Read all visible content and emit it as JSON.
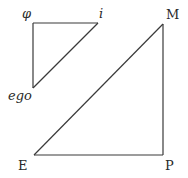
{
  "diagram": {
    "type": "two right-triangle schema",
    "small_triangle": {
      "vertices": {
        "phi": {
          "label": "φ",
          "x": 33,
          "y": 23
        },
        "i": {
          "label": "i",
          "x": 98,
          "y": 23
        },
        "ego": {
          "label": "ego",
          "x": 33,
          "y": 88
        }
      },
      "edges": [
        [
          "phi",
          "i"
        ],
        [
          "phi",
          "ego"
        ],
        [
          "i",
          "ego"
        ]
      ]
    },
    "large_triangle": {
      "vertices": {
        "M": {
          "label": "M",
          "x": 163,
          "y": 24
        },
        "P": {
          "label": "P",
          "x": 163,
          "y": 155
        },
        "E": {
          "label": "E",
          "x": 34,
          "y": 155
        }
      },
      "edges": [
        [
          "M",
          "P"
        ],
        [
          "P",
          "E"
        ],
        [
          "E",
          "M"
        ]
      ]
    },
    "labels": {
      "phi": "φ",
      "i": "i",
      "ego": "ego",
      "M": "M",
      "E": "E",
      "P": "P"
    },
    "colors": {
      "line": "#3a3a3a",
      "text": "#2a2a2a",
      "background": "#ffffff"
    }
  }
}
